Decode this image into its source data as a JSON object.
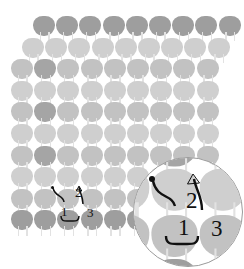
{
  "figure": {
    "type": "lattice-loop-diagram",
    "background_color": "#ffffff"
  },
  "palette": {
    "cell_light": "#cfcfcf",
    "cell_mid": "#c2c2c2",
    "cell_dark": "#9e9e9e",
    "cell_highlight": "#a5a5a5",
    "leg_line": "#e4e4e4",
    "inset_border": "#9b9b9b",
    "annotation": "#111111"
  },
  "grid": {
    "rows": 10,
    "columns_per_row": 10,
    "row_labels": [
      "row-1",
      "row-2",
      "row-3",
      "row-4",
      "row-5",
      "row-6",
      "row-7",
      "row-8",
      "row-9",
      "row-10"
    ],
    "dark_rows": [
      1,
      10
    ],
    "highlighted_cells": [
      {
        "row": 3,
        "column": 2
      },
      {
        "row": 5,
        "column": 2
      },
      {
        "row": 7,
        "column": 2
      }
    ]
  },
  "annotations": {
    "main": [
      {
        "id": "label-1",
        "text": "1",
        "x": 61,
        "y": 205,
        "size": 13
      },
      {
        "id": "label-2",
        "text": "2",
        "x": 75,
        "y": 186,
        "size": 13
      },
      {
        "id": "label-3",
        "text": "3",
        "x": 87,
        "y": 206,
        "size": 13
      }
    ],
    "inset": [
      {
        "id": "inset-label-1",
        "text": "1",
        "x": 178,
        "y": 216,
        "size": 23
      },
      {
        "id": "inset-label-2",
        "text": "2",
        "x": 186,
        "y": 189,
        "size": 23
      },
      {
        "id": "inset-label-3",
        "text": "3",
        "x": 211,
        "y": 217,
        "size": 23
      }
    ],
    "marker_dot_label": "reference-point-dot",
    "pointer_label": "leader-line",
    "arrow_label": "arrow-pointer",
    "brace_label": "span-brace"
  },
  "inset": {
    "name": "magnifier-inset",
    "center_x": 188,
    "center_y": 212,
    "radius": 55,
    "zoom_factor": 2.1
  }
}
